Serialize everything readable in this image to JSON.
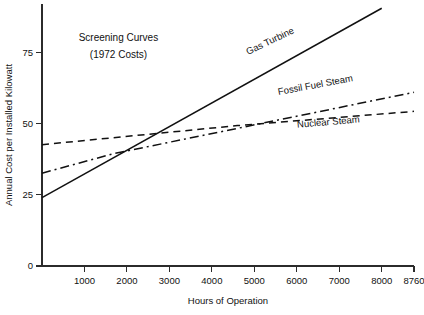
{
  "chart_data": {
    "type": "line",
    "title": "Screening Curves",
    "subtitle": "(1972 Costs)",
    "xlabel": "Hours of Operation",
    "ylabel": "Annual Cost per Installed Kilowatt",
    "xlim": [
      0,
      8760
    ],
    "ylim": [
      0,
      92
    ],
    "grid": false,
    "legend_position": "inline-labels",
    "xticks": [
      1000,
      2000,
      3000,
      4000,
      5000,
      6000,
      7000,
      8000,
      8760
    ],
    "xtick_labels": [
      "1000",
      "2000",
      "3000",
      "4000",
      "5000",
      "6000",
      "7000",
      "8000",
      "8760"
    ],
    "yticks": [
      0,
      25,
      50,
      75
    ],
    "ytick_labels": [
      "0",
      "25",
      "50",
      "75"
    ],
    "series": [
      {
        "name": "Gas Turbine",
        "line_style": "solid",
        "color": "#111111",
        "x": [
          0,
          8000
        ],
        "y": [
          24,
          90.5
        ],
        "label": "Gas Turbine",
        "label_x": 5400,
        "label_y": 78,
        "label_angle": -25.5
      },
      {
        "name": "Fossil Fuel Steam",
        "line_style": "dashdot",
        "color": "#111111",
        "x": [
          0,
          1700,
          8760
        ],
        "y": [
          32.6,
          39.5,
          61.0
        ],
        "label": "Fossil Fuel Steam",
        "label_x": 6450,
        "label_y": 62.5,
        "label_angle": -10.5
      },
      {
        "name": "Nuclear Steam",
        "line_style": "dashed",
        "color": "#111111",
        "x": [
          0,
          4600,
          8760
        ],
        "y": [
          42.6,
          49.3,
          54.3
        ],
        "label": "Nuclear Steam",
        "label_x": 6750,
        "label_y": 49.5,
        "label_angle": -5.0
      }
    ],
    "annotations": [
      {
        "text": "Screening Curves",
        "x": 1800,
        "y": 79
      },
      {
        "text": "(1972 Costs)",
        "x": 1800,
        "y": 73
      }
    ],
    "crossover_points": [
      {
        "between": [
          "Gas Turbine",
          "Fossil Fuel Steam"
        ],
        "x": 1520,
        "y": 36.6
      },
      {
        "between": [
          "Gas Turbine",
          "Nuclear Steam"
        ],
        "x": 2430,
        "y": 44.2
      },
      {
        "between": [
          "Fossil Fuel Steam",
          "Nuclear Steam"
        ],
        "x": 4800,
        "y": 49.6
      }
    ]
  },
  "axes": {
    "x_axis_name": "Hours of Operation",
    "y_axis_name": "Annual Cost per Installed Kilowatt"
  }
}
